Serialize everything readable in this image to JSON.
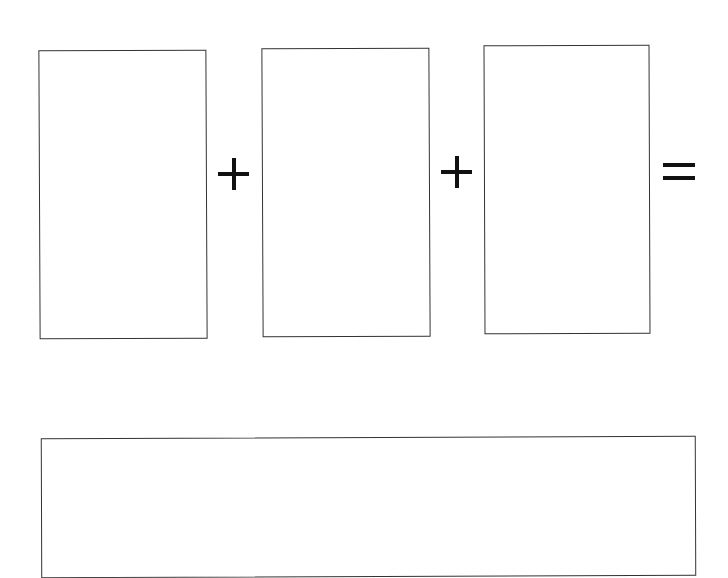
{
  "diagram": {
    "type": "equation-worksheet",
    "addend_boxes": [
      {
        "id": "box1",
        "content": ""
      },
      {
        "id": "box2",
        "content": ""
      },
      {
        "id": "box3",
        "content": ""
      }
    ],
    "operators": [
      {
        "symbol": "+",
        "icon": "plus-icon"
      },
      {
        "symbol": "+",
        "icon": "plus-icon"
      },
      {
        "symbol": "=",
        "icon": "equals-icon"
      }
    ],
    "result_box": {
      "content": ""
    },
    "stroke_color": "#333333",
    "symbol_color": "#111111",
    "background_color": "#ffffff"
  }
}
